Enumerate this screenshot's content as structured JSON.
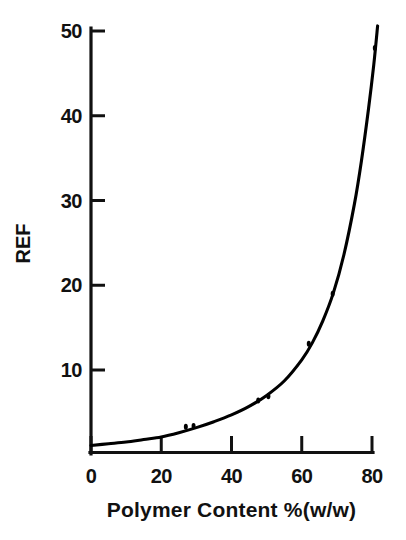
{
  "chart_data": {
    "type": "scatter",
    "title": "",
    "xlabel": "Polymer Content %(w/w)",
    "ylabel": "REF",
    "xlim": [
      0,
      82
    ],
    "ylim": [
      0,
      51
    ],
    "xticks": [
      0,
      20,
      40,
      60,
      80
    ],
    "xtick_labels": [
      "0",
      "20",
      "40",
      "60",
      "80"
    ],
    "yticks": [
      10,
      20,
      30,
      40,
      50
    ],
    "ytick_labels": [
      "10",
      "20",
      "30",
      "40",
      "50"
    ],
    "grid": false,
    "legend": null,
    "series": [
      {
        "name": "measurements",
        "marker": "point",
        "color": "#000000",
        "points": [
          {
            "x": 27.0,
            "y": 3.3
          },
          {
            "x": 29.2,
            "y": 3.4
          },
          {
            "x": 47.6,
            "y": 6.4
          },
          {
            "x": 50.5,
            "y": 6.9
          },
          {
            "x": 62.0,
            "y": 13.1
          },
          {
            "x": 68.8,
            "y": 19.0
          },
          {
            "x": 80.8,
            "y": 48.0
          }
        ]
      },
      {
        "name": "fitted-exponential-curve",
        "marker": "line",
        "color": "#000000",
        "curve": [
          {
            "x": 0.0,
            "y": 1.1
          },
          {
            "x": 5.0,
            "y": 1.3
          },
          {
            "x": 10.0,
            "y": 1.5
          },
          {
            "x": 15.0,
            "y": 1.8
          },
          {
            "x": 20.0,
            "y": 2.1
          },
          {
            "x": 25.0,
            "y": 2.6
          },
          {
            "x": 30.0,
            "y": 3.2
          },
          {
            "x": 35.0,
            "y": 3.9
          },
          {
            "x": 40.0,
            "y": 4.7
          },
          {
            "x": 45.0,
            "y": 5.7
          },
          {
            "x": 50.0,
            "y": 7.0
          },
          {
            "x": 55.0,
            "y": 8.7
          },
          {
            "x": 60.0,
            "y": 11.2
          },
          {
            "x": 63.0,
            "y": 13.2
          },
          {
            "x": 66.0,
            "y": 15.8
          },
          {
            "x": 69.0,
            "y": 19.1
          },
          {
            "x": 72.0,
            "y": 23.6
          },
          {
            "x": 75.0,
            "y": 29.6
          },
          {
            "x": 77.0,
            "y": 34.7
          },
          {
            "x": 79.0,
            "y": 40.8
          },
          {
            "x": 80.5,
            "y": 46.0
          },
          {
            "x": 81.6,
            "y": 50.6
          }
        ]
      }
    ]
  },
  "axes": {
    "axis_color": "#111111",
    "tick_direction": "in"
  }
}
